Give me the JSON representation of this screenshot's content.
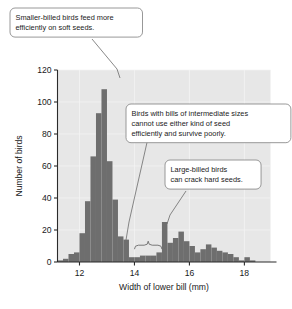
{
  "chart_data": {
    "type": "bar",
    "title": "",
    "xlabel": "Width of lower bill (mm)",
    "ylabel": "Number of birds",
    "xlim": [
      11.2,
      18.95
    ],
    "ylim": [
      0,
      120
    ],
    "xticks": [
      12,
      14,
      16,
      18
    ],
    "xtick_labels": [
      "12",
      "14",
      "16",
      "18"
    ],
    "yticks": [
      0,
      20,
      40,
      60,
      80,
      100,
      120
    ],
    "ytick_labels": [
      "0",
      "20",
      "40",
      "60",
      "80",
      "100",
      "120"
    ],
    "grid": true,
    "legend": "none",
    "bin_width": 0.2,
    "bar_color": "#6e6e6e",
    "plot_background": "#e7e7e7",
    "series": [
      {
        "name": "Number of birds",
        "x": [
          11.3,
          11.5,
          11.7,
          11.9,
          12.1,
          12.3,
          12.5,
          12.7,
          12.9,
          13.1,
          13.3,
          13.5,
          13.7,
          13.9,
          14.1,
          14.3,
          14.5,
          14.7,
          14.9,
          15.1,
          15.3,
          15.5,
          15.7,
          15.9,
          16.1,
          16.3,
          16.5,
          16.7,
          16.9,
          17.1,
          17.3,
          17.5,
          17.7,
          17.9,
          18.1,
          18.3,
          18.5,
          18.7
        ],
        "values": [
          1,
          2,
          5,
          6,
          18,
          38,
          66,
          93,
          108,
          63,
          39,
          16,
          14,
          3,
          3,
          4,
          4,
          4,
          6,
          25,
          12,
          15,
          19,
          13,
          10,
          6,
          8,
          11,
          9,
          7,
          6,
          5,
          3,
          1,
          3,
          1,
          0,
          0
        ]
      }
    ],
    "annotations": [
      {
        "id": "small-bill",
        "text_lines": [
          "Smaller-billed birds feed more",
          "efficiently on soft seeds."
        ],
        "points_to_x": 12.9,
        "points_to_y": 110
      },
      {
        "id": "intermediate-bill",
        "text_lines": [
          "Birds with bills of intermediate sizes",
          "cannot use either kind of seed",
          "efficiently and survive poorly."
        ],
        "points_to_x": 14.5,
        "points_to_y": 8
      },
      {
        "id": "large-bill",
        "text_lines": [
          "Large-billed birds",
          "can crack hard seeds."
        ],
        "points_to_x": 15.7,
        "points_to_y": 19
      }
    ],
    "brace": {
      "from_x": 14.0,
      "to_x": 15.0,
      "at_y": 8,
      "label": ""
    }
  }
}
